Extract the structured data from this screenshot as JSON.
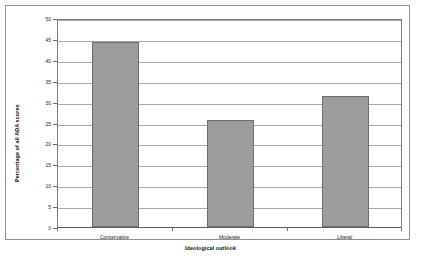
{
  "chart_data": {
    "type": "bar",
    "title": "",
    "subtitle": "",
    "categories": [
      "Conservative",
      "Moderate",
      "Liberal"
    ],
    "values": [
      44.2,
      25.6,
      31.4
    ],
    "xlabel": "Ideological outlook",
    "ylabel": "Percentage of all ADA scores",
    "ylim": [
      0,
      50
    ],
    "ytick_labels": [
      "0",
      "5",
      "10",
      "15",
      "20",
      "25",
      "30",
      "35",
      "40",
      "45",
      "50"
    ],
    "ytick_values": [
      0,
      5,
      10,
      15,
      20,
      25,
      30,
      35,
      40,
      45,
      50
    ],
    "grid": true,
    "grid_axis": "y",
    "legend": false,
    "legend_position": "none",
    "bar_color": "#9c9c9c",
    "bar_edge_color": "#6d6d6d",
    "gridline_color": "#a8a8a8",
    "axis_color": "#7a7a7a",
    "background_color": "#ffffff",
    "frame_color": "#8f8f8f"
  }
}
